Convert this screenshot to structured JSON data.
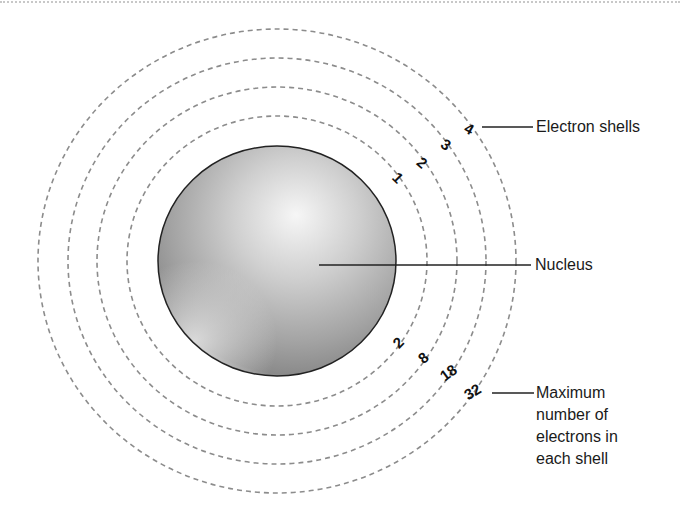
{
  "diagram": {
    "labels": {
      "electron_shells": "Electron shells",
      "nucleus": "Nucleus",
      "max_electrons": "Maximum number of electrons in each shell"
    },
    "shells": [
      {
        "number": "1",
        "max_electrons": "2"
      },
      {
        "number": "2",
        "max_electrons": "8"
      },
      {
        "number": "3",
        "max_electrons": "18"
      },
      {
        "number": "4",
        "max_electrons": "32"
      }
    ],
    "colors": {
      "shell_dash": "#8c8c8c",
      "nucleus_outline": "#222222",
      "nucleus_highlight": "#f4f4f4",
      "nucleus_shadow": "#7d7d7d",
      "text": "#1a1a1a"
    }
  }
}
